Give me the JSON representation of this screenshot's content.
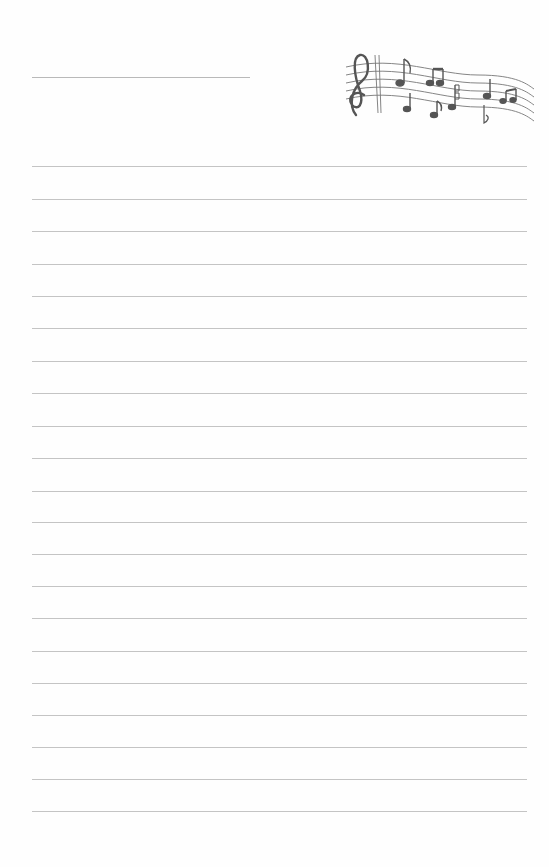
{
  "document": {
    "type": "lined stationery",
    "header": {
      "name_line": "",
      "decoration": "music-staff-icon"
    },
    "ruled_lines": {
      "count": 21,
      "top_positions": [
        166,
        199,
        231,
        264,
        296,
        328,
        361,
        393,
        426,
        458,
        491,
        522,
        554,
        586,
        618,
        651,
        683,
        715,
        747,
        779,
        811
      ],
      "left": 32,
      "right": 527,
      "color": "#c4c4c4"
    },
    "colors": {
      "background": "#fefefe",
      "ink": "#555555"
    }
  }
}
